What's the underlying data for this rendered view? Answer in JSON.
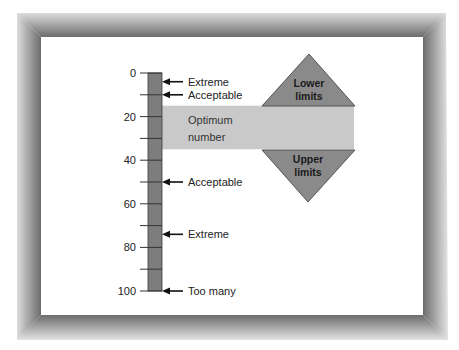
{
  "diagram": {
    "scale": {
      "min": 0,
      "max": 100,
      "major_ticks": [
        {
          "value": 0,
          "label": "0"
        },
        {
          "value": 20,
          "label": "20"
        },
        {
          "value": 40,
          "label": "40"
        },
        {
          "value": 60,
          "label": "60"
        },
        {
          "value": 80,
          "label": "80"
        },
        {
          "value": 100,
          "label": "100"
        }
      ],
      "minor_ticks": [
        10,
        30,
        50,
        70,
        90
      ]
    },
    "markers": [
      {
        "value": 4,
        "label": "Extreme"
      },
      {
        "value": 10,
        "label": "Acceptable"
      },
      {
        "value": 50,
        "label": "Acceptable"
      },
      {
        "value": 74,
        "label": "Extreme"
      },
      {
        "value": 100,
        "label": "Too many"
      }
    ],
    "optimum_band": {
      "from": 15,
      "to": 35,
      "label_line1": "Optimum",
      "label_line2": "number"
    },
    "lower_limits": {
      "line1": "Lower",
      "line2": "limits"
    },
    "upper_limits": {
      "line1": "Upper",
      "line2": "limits"
    },
    "colors": {
      "bar": "#7d7d7d",
      "band": "#c9c9c9",
      "triangle": "#8a8a8a",
      "outline": "#3a3a3a",
      "frame_dark": "#6e6e6e",
      "frame_light": "#e2e2e2"
    }
  }
}
